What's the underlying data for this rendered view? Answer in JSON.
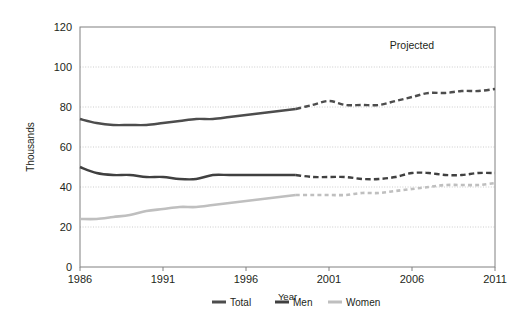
{
  "chart_data": {
    "type": "line",
    "title": "",
    "xlabel": "Year",
    "ylabel": "Thousands",
    "xlim": [
      1986,
      2011
    ],
    "ylim": [
      0,
      120
    ],
    "grid": true,
    "legend_position": "bottom",
    "x_ticks": [
      "1986",
      "1991",
      "1996",
      "2001",
      "2006",
      "2011"
    ],
    "y_ticks": [
      "0",
      "20",
      "40",
      "60",
      "80",
      "100",
      "120"
    ],
    "annotations": [
      {
        "text": "Projected",
        "x": 2006,
        "y": 109
      }
    ],
    "projection_starts": 1999,
    "x": [
      1986,
      1987,
      1988,
      1989,
      1990,
      1991,
      1992,
      1993,
      1994,
      1995,
      1996,
      1997,
      1998,
      1999,
      2000,
      2001,
      2002,
      2003,
      2004,
      2005,
      2006,
      2007,
      2008,
      2009,
      2010,
      2011
    ],
    "series": [
      {
        "name": "Total",
        "color": "#4d4d4d",
        "values": [
          74,
          72,
          71,
          71,
          71,
          72,
          73,
          74,
          74,
          75,
          76,
          77,
          78,
          79,
          81,
          83,
          81,
          81,
          81,
          83,
          85,
          87,
          87,
          88,
          88,
          89
        ],
        "solid_through": 1999
      },
      {
        "name": "Men",
        "color": "#404040",
        "values": [
          50,
          47,
          46,
          46,
          45,
          45,
          44,
          44,
          46,
          46,
          46,
          46,
          46,
          46,
          45,
          45,
          45,
          44,
          44,
          45,
          47,
          47,
          46,
          46,
          47,
          47
        ],
        "solid_through": 1999
      },
      {
        "name": "Women",
        "color": "#bfbfbf",
        "values": [
          24,
          24,
          25,
          26,
          28,
          29,
          30,
          30,
          31,
          32,
          33,
          34,
          35,
          36,
          36,
          36,
          36,
          37,
          37,
          38,
          39,
          40,
          41,
          41,
          41,
          42
        ],
        "solid_through": 1999
      }
    ]
  },
  "legend": {
    "items": [
      {
        "label": "Total",
        "color": "#4d4d4d"
      },
      {
        "label": "Men",
        "color": "#404040"
      },
      {
        "label": "Women",
        "color": "#bfbfbf"
      }
    ]
  }
}
